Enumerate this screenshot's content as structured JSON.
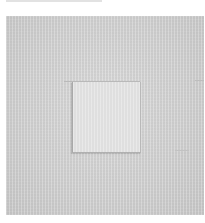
{
  "image": {
    "subject": "minimalist artwork: light gray textured square canvas with smaller lighter square inset at center",
    "colors": {
      "background": "#ffffff",
      "canvas": "#d0d0d0",
      "inset_square": "#e3e3e3",
      "edge_lines": "#aaaaaa"
    }
  }
}
